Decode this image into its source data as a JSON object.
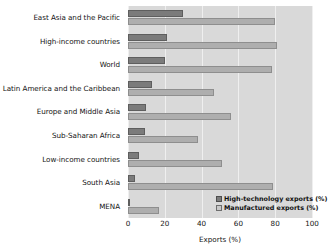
{
  "chart_data": {
    "type": "bar",
    "orientation": "horizontal",
    "title": "",
    "xlabel": "Exports (%)",
    "ylabel": "",
    "xlim": [
      0,
      100
    ],
    "xticks": [
      0,
      20,
      40,
      60,
      80,
      100
    ],
    "grid": true,
    "legend_position": "bottom-right",
    "categories": [
      "East Asia and the Pacific",
      "High-income countries",
      "World",
      "Latin America and the Caribbean",
      "Europe and Middle Asia",
      "Sub-Saharan Africa",
      "Low-income countries",
      "South Asia",
      "MENA"
    ],
    "series": [
      {
        "name": "High-technology exports (%)",
        "color": "#7b7b7b",
        "values": [
          30,
          21,
          20,
          13,
          10,
          9,
          6,
          4,
          1
        ]
      },
      {
        "name": "Manufactured exports (%)",
        "color": "#aeaeae",
        "values": [
          80,
          81,
          78,
          47,
          56,
          38,
          51,
          79,
          17
        ]
      }
    ]
  },
  "legend": {
    "items": [
      {
        "label": "High-technology exports (%)",
        "swatch": "hitech"
      },
      {
        "label": "Manufactured exports (%)",
        "swatch": "manuf"
      }
    ]
  },
  "colors": {
    "plot_background": "#d9d9d9",
    "gridline": "#efefef",
    "high_technology": "#7b7b7b",
    "manufactured": "#aeaeae",
    "text": "#141414"
  }
}
